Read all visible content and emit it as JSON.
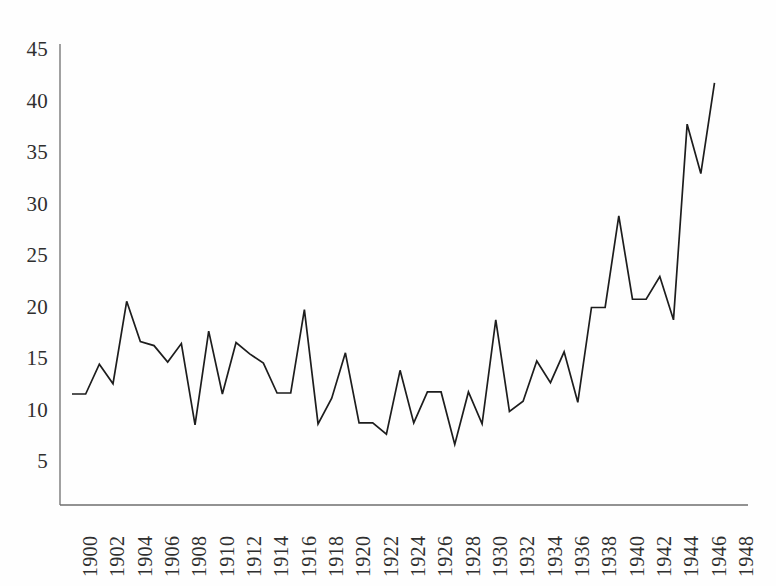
{
  "chart_data": {
    "type": "line",
    "title": "",
    "subtitle": "",
    "xlabel": "",
    "ylabel": "",
    "grid": false,
    "legend": "none",
    "xlim": [
      1900,
      1949
    ],
    "ylim": [
      0,
      46
    ],
    "yticks": [
      5,
      10,
      15,
      20,
      25,
      30,
      35,
      40,
      45
    ],
    "ytick_labels": [
      "5",
      "10",
      "15",
      "20",
      "25",
      "30",
      "35",
      "40",
      "45"
    ],
    "xticks": [
      1900,
      1902,
      1904,
      1906,
      1908,
      1910,
      1912,
      1914,
      1916,
      1918,
      1920,
      1922,
      1924,
      1926,
      1928,
      1930,
      1932,
      1934,
      1936,
      1938,
      1940,
      1942,
      1944,
      1946,
      1948
    ],
    "xtick_labels": [
      "1900",
      "1902",
      "1904",
      "1906",
      "1908",
      "1910",
      "1912",
      "1914",
      "1916",
      "1918",
      "1920",
      "1922",
      "1924",
      "1926",
      "1928",
      "1930",
      "1932",
      "1934",
      "1936",
      "1938",
      "1940",
      "1942",
      "1944",
      "1946",
      "1948"
    ],
    "series": [
      {
        "name": "series-1",
        "color": "#1d1d1d",
        "x": [
          1900,
          1901,
          1902,
          1903,
          1904,
          1905,
          1906,
          1907,
          1908,
          1909,
          1910,
          1911,
          1912,
          1913,
          1914,
          1915,
          1916,
          1917,
          1918,
          1919,
          1920,
          1921,
          1922,
          1923,
          1924,
          1925,
          1926,
          1927,
          1928,
          1929,
          1930,
          1931,
          1932,
          1933,
          1934,
          1935,
          1936,
          1937,
          1938,
          1939,
          1940,
          1941,
          1942,
          1943,
          1944,
          1945,
          1946,
          1947
        ],
        "values": [
          11.6,
          11.6,
          14.5,
          12.6,
          20.6,
          16.7,
          16.3,
          14.7,
          16.5,
          8.6,
          17.7,
          11.6,
          16.6,
          15.5,
          14.6,
          11.7,
          11.7,
          19.8,
          8.7,
          11.2,
          15.6,
          8.8,
          8.8,
          7.7,
          13.9,
          8.8,
          11.8,
          11.8,
          6.7,
          11.8,
          8.7,
          18.8,
          9.9,
          10.9,
          14.8,
          12.7,
          15.7,
          10.8,
          20.0,
          20.0,
          28.9,
          20.8,
          20.8,
          23.0,
          18.8,
          37.8,
          33.0,
          41.8
        ]
      }
    ]
  },
  "axes": {
    "y_axis_name": "value-axis",
    "x_axis_name": "year-axis"
  }
}
